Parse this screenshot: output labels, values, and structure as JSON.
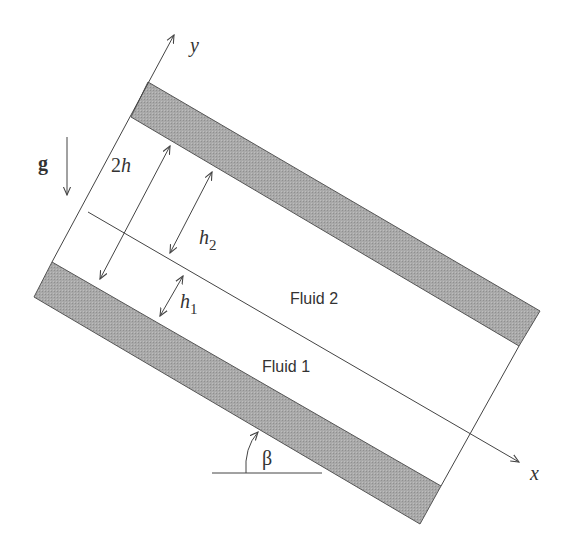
{
  "diagram": {
    "axes": {
      "x_label": "x",
      "y_label": "y"
    },
    "gravity_label": "g",
    "dimensions": {
      "total_gap": "2h",
      "upper_layer": "h",
      "upper_layer_sub": "2",
      "lower_layer": "h",
      "lower_layer_sub": "1"
    },
    "angle_label": "β",
    "regions": {
      "upper_fluid": "Fluid 2",
      "lower_fluid": "Fluid 1"
    },
    "colors": {
      "wall_fill": "#a8a8a8",
      "line": "#444444",
      "background": "#ffffff"
    }
  }
}
